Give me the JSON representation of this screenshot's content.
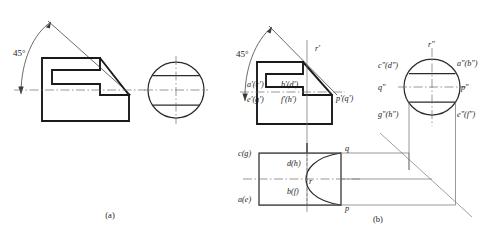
{
  "figure": {
    "title_a": "(a)",
    "title_b": "(b)",
    "angle_label_a": "45°",
    "angle_label_b": "45°"
  },
  "labels_front_view": {
    "ac": "a'(c')",
    "bd": "b'(d')",
    "eg": "e'(g')",
    "fh": "f'(h')",
    "pq": "p'(q')",
    "r": "r'"
  },
  "labels_side_view": {
    "cd": "c\"(d\")",
    "ab": "a\"(b\")",
    "q": "q\"",
    "p": "p\"",
    "gh": "g\"(h\")",
    "ef": "e\"(f\")",
    "r": "r\""
  },
  "labels_top_view": {
    "cg": "c(g)",
    "dh": "d(h)",
    "ae": "a(e)",
    "bf": "b(f)",
    "r": "r",
    "q": "q",
    "p": "p"
  },
  "colors": {
    "outline": "#1a1a1a",
    "thin": "#6f6f6f",
    "center": "#6a6a6a",
    "hidden": "#7a7a7a",
    "background": "#ffffff"
  }
}
